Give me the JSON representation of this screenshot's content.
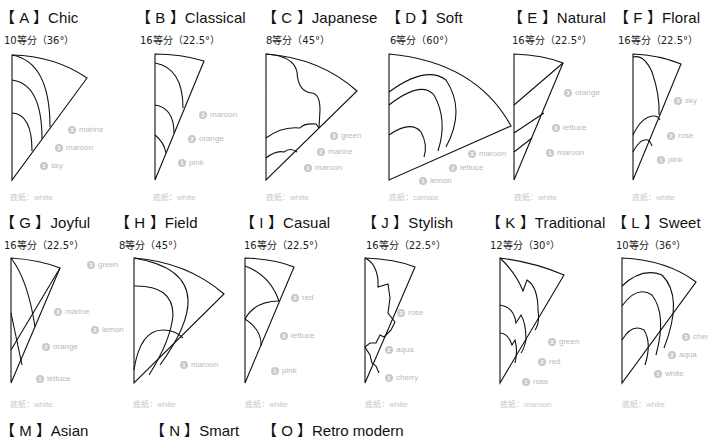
{
  "panels": [
    {
      "id": "A",
      "title": "【 A 】Chic",
      "division": "10等分（36°）",
      "base": "底紙：white",
      "labels": [
        {
          "n": "3",
          "text": "marine"
        },
        {
          "n": "2",
          "text": "maroon"
        },
        {
          "n": "1",
          "text": "sky"
        }
      ]
    },
    {
      "id": "B",
      "title": "【 B 】Classical",
      "division": "16等分（22.5°）",
      "base": "底紙：white",
      "labels": [
        {
          "n": "3",
          "text": "maroon"
        },
        {
          "n": "2",
          "text": "orange"
        },
        {
          "n": "1",
          "text": "pink"
        }
      ]
    },
    {
      "id": "C",
      "title": "【 C 】Japanese",
      "division": "8等分（45°）",
      "base": "底紙：white",
      "labels": [
        {
          "n": "3",
          "text": "green"
        },
        {
          "n": "2",
          "text": "marine"
        },
        {
          "n": "1",
          "text": "maroon"
        }
      ]
    },
    {
      "id": "D",
      "title": "【 D 】Soft",
      "division": "6等分（60°）",
      "base": "底紙：camaie",
      "labels": [
        {
          "n": "3",
          "text": "maroon"
        },
        {
          "n": "2",
          "text": "lettuce"
        },
        {
          "n": "1",
          "text": "lemon"
        }
      ]
    },
    {
      "id": "E",
      "title": "【 E 】Natural",
      "division": "16等分（22.5°）",
      "base": "底紙：white",
      "labels": [
        {
          "n": "3",
          "text": "orange"
        },
        {
          "n": "2",
          "text": "lettuce"
        },
        {
          "n": "1",
          "text": "maroon"
        }
      ]
    },
    {
      "id": "F",
      "title": "【 F 】Floral",
      "division": "16等分（22.5°）",
      "base": "底紙：white",
      "labels": [
        {
          "n": "3",
          "text": "sky"
        },
        {
          "n": "2",
          "text": "rose"
        },
        {
          "n": "1",
          "text": "pink"
        }
      ]
    },
    {
      "id": "G",
      "title": "【 G 】Joyful",
      "division": "16等分（22.5°）",
      "base": "底紙：white",
      "labels": [
        {
          "n": "3",
          "text": "marine"
        },
        {
          "n": "2",
          "text": "orange"
        },
        {
          "n": "1",
          "text": "lettuce"
        }
      ]
    },
    {
      "id": "H",
      "title": "【 H 】Field",
      "division": "8等分（45°）",
      "base": "底紙：white",
      "labels": [
        {
          "n": "3",
          "text": "green"
        },
        {
          "n": "2",
          "text": "lemon"
        },
        {
          "n": "1",
          "text": "maroon"
        }
      ]
    },
    {
      "id": "I",
      "title": "【 I 】Casual",
      "division": "16等分（22.5°）",
      "base": "底紙：white",
      "labels": [
        {
          "n": "3",
          "text": "red"
        },
        {
          "n": "2",
          "text": "lettuce"
        },
        {
          "n": "1",
          "text": "pink"
        }
      ]
    },
    {
      "id": "J",
      "title": "【 J 】Stylish",
      "division": "16等分（22.5°）",
      "base": "底紙：white",
      "labels": [
        {
          "n": "3",
          "text": "rose"
        },
        {
          "n": "2",
          "text": "aqua"
        },
        {
          "n": "1",
          "text": "cherry"
        }
      ]
    },
    {
      "id": "K",
      "title": "【 K 】Traditional",
      "division": "12等分（30°）",
      "base": "底紙：maroon",
      "labels": [
        {
          "n": "3",
          "text": "green"
        },
        {
          "n": "2",
          "text": "red"
        },
        {
          "n": "1",
          "text": "rose"
        }
      ]
    },
    {
      "id": "L",
      "title": "【 L 】Sweet",
      "division": "10等分（36°）",
      "base": "底紙：white",
      "labels": [
        {
          "n": "3",
          "text": "cherry"
        },
        {
          "n": "2",
          "text": "aqua"
        },
        {
          "n": "1",
          "text": "white"
        }
      ]
    }
  ],
  "bottom_titles": [
    {
      "id": "M",
      "title": "【 M 】Asian"
    },
    {
      "id": "N",
      "title": "【 N 】Smart"
    },
    {
      "id": "O",
      "title": "【 O 】Retro modern"
    }
  ],
  "colors": {
    "line": "#111111",
    "label": "#b9b9b9",
    "badge": "#c8c8c8"
  }
}
